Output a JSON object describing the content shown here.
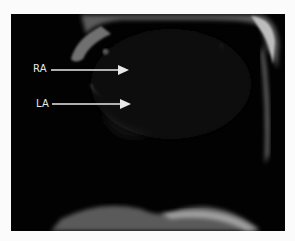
{
  "figure": {
    "background_color": "#fbfbfb",
    "panel_color": "#020202",
    "annotations": [
      {
        "label": "RA",
        "arrow": "right-arrow"
      },
      {
        "label": "LA",
        "arrow": "right-arrow"
      }
    ]
  }
}
